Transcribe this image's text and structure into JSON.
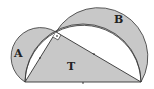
{
  "diagram": {
    "labels": {
      "lune_left": "A",
      "lune_right": "B",
      "triangle": "T"
    },
    "colors": {
      "fill": "#c8c8c8",
      "stroke": "#333333",
      "background": "#ffffff"
    },
    "points": {
      "left": [
        25,
        82
      ],
      "right": [
        141,
        82
      ],
      "apex": [
        56,
        32
      ]
    }
  }
}
